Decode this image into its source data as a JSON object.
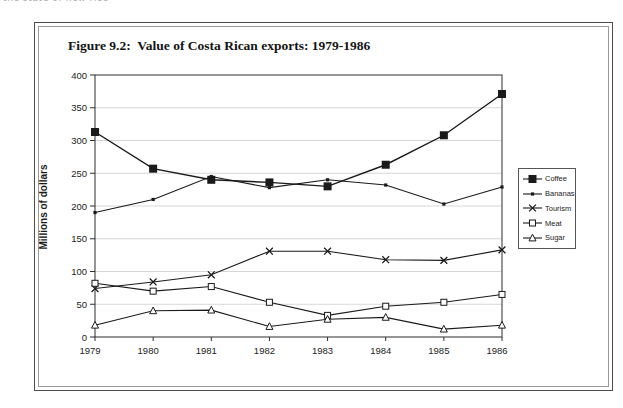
{
  "page": {
    "top_fragment": "the state of new rice"
  },
  "figure": {
    "title": "Figure 9.2:  Value of Costa Rican exports: 1979-1986"
  },
  "chart_data": {
    "type": "line",
    "title": "Figure 9.2: Value of Costa Rican exports: 1979-1986",
    "x": [
      "1979",
      "1980",
      "1981",
      "1982",
      "1983",
      "1984",
      "1985",
      "1986"
    ],
    "xlabel": "",
    "ylabel": "Millions of dollars",
    "ylim": [
      0,
      400
    ],
    "ytick_step": 50,
    "grid": true,
    "legend_position": "right-outside",
    "series": [
      {
        "name": "Coffee",
        "marker": "filled-square",
        "values": [
          313,
          257,
          240,
          236,
          230,
          263,
          308,
          371
        ]
      },
      {
        "name": "Bananas",
        "marker": "small-dot",
        "values": [
          190,
          210,
          245,
          228,
          240,
          232,
          203,
          229
        ]
      },
      {
        "name": "Tourism",
        "marker": "x",
        "values": [
          74,
          84,
          95,
          131,
          131,
          118,
          117,
          133
        ]
      },
      {
        "name": "Meat",
        "marker": "open-square",
        "values": [
          82,
          70,
          77,
          53,
          33,
          47,
          53,
          65
        ]
      },
      {
        "name": "Sugar",
        "marker": "open-triangle",
        "values": [
          18,
          40,
          41,
          16,
          27,
          30,
          12,
          18
        ]
      }
    ],
    "colors": {
      "line": "#1a1a1a",
      "grid": "#c6c6c6",
      "axis": "#2e2e2e"
    }
  }
}
